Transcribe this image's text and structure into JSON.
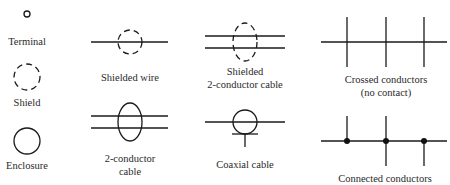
{
  "diagram": {
    "type": "electrical-symbol-legend",
    "colors": {
      "ink": "#1a1a1a",
      "text": "#2a2a2a",
      "background": "#ffffff"
    },
    "symbols": [
      {
        "id": "terminal",
        "label_lines": [
          "Terminal"
        ],
        "icon": "small-open-circle"
      },
      {
        "id": "shield",
        "label_lines": [
          "Shield"
        ],
        "icon": "dashed-circle"
      },
      {
        "id": "enclosure",
        "label_lines": [
          "Enclosure"
        ],
        "icon": "solid-circle-outline"
      },
      {
        "id": "shielded-wire",
        "label_lines": [
          "Shielded wire"
        ],
        "icon": "line-through-dashed-circle"
      },
      {
        "id": "two-conductor-cable",
        "label_lines": [
          "2-conductor",
          "cable"
        ],
        "icon": "two-lines-through-ellipse"
      },
      {
        "id": "shielded-two-conductor-cable",
        "label_lines": [
          "Shielded",
          "2-conductor cable"
        ],
        "icon": "two-lines-through-dashed-ellipse"
      },
      {
        "id": "coaxial-cable",
        "label_lines": [
          "Coaxial cable"
        ],
        "icon": "line-through-circle-with-ground-tap"
      },
      {
        "id": "crossed-conductors",
        "label_lines": [
          "Crossed conductors",
          "(no contact)"
        ],
        "icon": "horizontal-line-crossed-by-three-verticals"
      },
      {
        "id": "connected-conductors",
        "label_lines": [
          "Connected conductors"
        ],
        "icon": "horizontal-line-with-three-dotted-junctions"
      }
    ]
  }
}
